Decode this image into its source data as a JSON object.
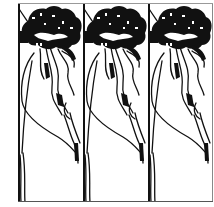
{
  "artwork": {
    "type": "repeating-pattern",
    "description": "Black ink line-art of a stylized tree with dense foliage, repeated in three vertical panels",
    "panel_count": 3,
    "panels": [
      {
        "index": 0,
        "subject": "stylized-tree"
      },
      {
        "index": 1,
        "subject": "stylized-tree"
      },
      {
        "index": 2,
        "subject": "stylized-tree"
      }
    ],
    "colors": {
      "ink": "#111111",
      "background": "#ffffff"
    }
  }
}
